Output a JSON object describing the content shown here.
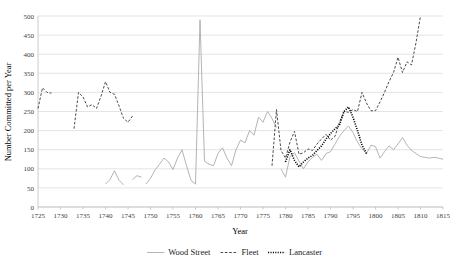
{
  "chart_data": {
    "type": "line",
    "title": "",
    "xlabel": "Year",
    "ylabel": "Number Committed per Year",
    "xlim": [
      1725,
      1815
    ],
    "ylim": [
      0,
      500
    ],
    "grid": true,
    "legend_position": "bottom",
    "x_ticks": [
      1725,
      1730,
      1735,
      1740,
      1745,
      1750,
      1755,
      1760,
      1765,
      1770,
      1775,
      1780,
      1785,
      1790,
      1795,
      1800,
      1805,
      1810,
      1815
    ],
    "y_ticks": [
      0,
      50,
      100,
      150,
      200,
      250,
      300,
      350,
      400,
      450,
      500
    ],
    "series": [
      {
        "name": "Wood Street",
        "style": "solid",
        "color": "#a6a6a6",
        "segments": [
          {
            "x": [
              1740,
              1741,
              1742,
              1743,
              1744
            ],
            "y": [
              60,
              72,
              95,
              70,
              58
            ]
          },
          {
            "x": [
              1746,
              1747,
              1748
            ],
            "y": [
              72,
              82,
              78
            ]
          },
          {
            "x": [
              1749,
              1750,
              1751,
              1752,
              1753,
              1754,
              1755,
              1756,
              1757,
              1758,
              1759,
              1760,
              1761,
              1762,
              1763,
              1764,
              1765,
              1766,
              1767,
              1768,
              1769,
              1770,
              1771,
              1772,
              1773,
              1774,
              1775,
              1776,
              1777,
              1778
            ],
            "y": [
              60,
              75,
              97,
              112,
              128,
              118,
              98,
              128,
              150,
              108,
              70,
              60,
              490,
              120,
              112,
              108,
              140,
              155,
              128,
              108,
              150,
              175,
              168,
              200,
              188,
              235,
              222,
              250,
              232,
              208
            ]
          },
          {
            "x": [
              1779,
              1780,
              1781,
              1782,
              1783,
              1784,
              1785,
              1786,
              1787,
              1788,
              1789,
              1790,
              1791,
              1792,
              1793,
              1794,
              1795,
              1796,
              1797,
              1798,
              1799,
              1800,
              1801,
              1802,
              1803,
              1804,
              1805,
              1806,
              1807,
              1808,
              1809,
              1810,
              1811,
              1812,
              1813,
              1814,
              1815
            ],
            "y": [
              100,
              78,
              132,
              142,
              120,
              100,
              118,
              130,
              138,
              122,
              140,
              145,
              165,
              185,
              200,
              212,
              195,
              170,
              152,
              140,
              162,
              158,
              128,
              145,
              160,
              150,
              165,
              182,
              162,
              148,
              140,
              132,
              130,
              128,
              130,
              128,
              125
            ]
          }
        ]
      },
      {
        "name": "Fleet",
        "style": "dashed",
        "color": "#404040",
        "segments": [
          {
            "x": [
              1725,
              1726,
              1727,
              1728
            ],
            "y": [
              258,
              312,
              300,
              298
            ]
          },
          {
            "x": [
              1733,
              1734,
              1735,
              1736,
              1737,
              1738,
              1739,
              1740,
              1741,
              1742,
              1743,
              1744,
              1745,
              1746
            ],
            "y": [
              205,
              300,
              288,
              262,
              268,
              258,
              290,
              328,
              300,
              295,
              265,
              232,
              222,
              238
            ]
          },
          {
            "x": [
              1777,
              1778,
              1779,
              1780,
              1781,
              1782,
              1783,
              1784,
              1785,
              1786,
              1787,
              1788,
              1789,
              1790,
              1791,
              1792,
              1793,
              1794,
              1795,
              1796,
              1797,
              1798,
              1799,
              1800,
              1801,
              1802,
              1803,
              1804,
              1805,
              1806,
              1807,
              1808,
              1809,
              1810
            ],
            "y": [
              108,
              255,
              148,
              128,
              170,
              198,
              138,
              142,
              152,
              148,
              165,
              178,
              190,
              175,
              185,
              222,
              250,
              248,
              255,
              250,
              300,
              272,
              252,
              252,
              275,
              300,
              328,
              352,
              392,
              352,
              380,
              372,
              430,
              500
            ]
          }
        ]
      },
      {
        "name": "Lancaster",
        "style": "dotted",
        "color": "#000000",
        "segments": [
          {
            "x": [
              1780,
              1781,
              1782,
              1783,
              1784,
              1785,
              1786,
              1787,
              1788,
              1789,
              1790,
              1791,
              1792,
              1793,
              1794,
              1795,
              1796,
              1797,
              1798
            ],
            "y": [
              118,
              150,
              122,
              105,
              118,
              128,
              135,
              148,
              160,
              178,
              192,
              205,
              215,
              250,
              262,
              235,
              200,
              162,
              140
            ]
          }
        ]
      }
    ]
  },
  "legend": {
    "items": [
      {
        "label": "Wood Street",
        "style": "solid"
      },
      {
        "label": "Fleet",
        "style": "dashed"
      },
      {
        "label": "Lancaster",
        "style": "dotted"
      }
    ]
  }
}
